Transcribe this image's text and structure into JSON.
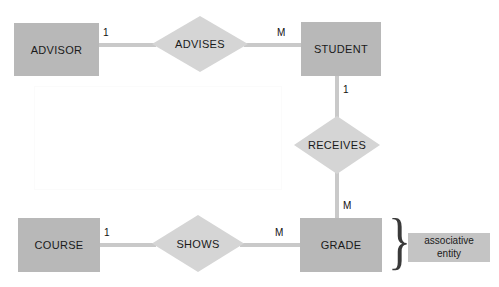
{
  "diagram": {
    "entities": [
      {
        "id": "advisor",
        "label": "ADVISOR"
      },
      {
        "id": "student",
        "label": "STUDENT"
      },
      {
        "id": "course",
        "label": "COURSE"
      },
      {
        "id": "grade",
        "label": "GRADE"
      }
    ],
    "relationships": [
      {
        "id": "advises",
        "label": "ADVISES"
      },
      {
        "id": "receives",
        "label": "RECEIVES"
      },
      {
        "id": "shows",
        "label": "SHOWS"
      }
    ],
    "cardinalities": [
      {
        "id": "advisor-advises",
        "value": "1"
      },
      {
        "id": "advises-student",
        "value": "M"
      },
      {
        "id": "student-receives",
        "value": "1"
      },
      {
        "id": "receives-grade",
        "value": "M"
      },
      {
        "id": "course-shows",
        "value": "1"
      },
      {
        "id": "shows-grade",
        "value": "M"
      }
    ],
    "annotations": [
      {
        "id": "associative-entity",
        "line1": "associative",
        "line2": "entity"
      }
    ],
    "colors": {
      "entity_fill": "#b8b8b8",
      "relationship_fill": "#d5d5d5",
      "connector": "#c9c9c9",
      "annotation_fill": "#c4c4c4",
      "text": "#1a1a1a",
      "background": "#ffffff"
    }
  }
}
